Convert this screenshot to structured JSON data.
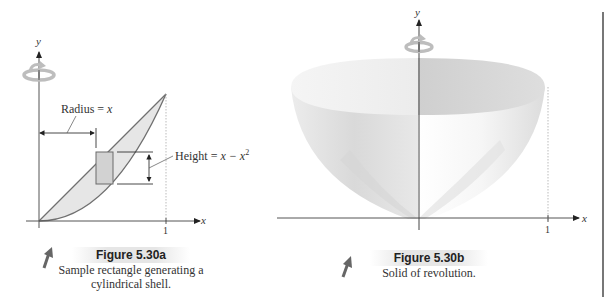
{
  "figure_a": {
    "title": "Figure 5.30a",
    "caption_line1": "Sample rectangle generating a",
    "caption_line2": "cylindrical shell.",
    "axes": {
      "x_label": "x",
      "y_label": "y",
      "x_tick": "1"
    },
    "annotations": {
      "radius_label": "Radius = ",
      "radius_var": "x",
      "height_label": "Height = ",
      "height_expr": "x − x",
      "height_exp": "2"
    },
    "curves": [
      "y = x",
      "y = x^2"
    ],
    "icons": [
      "rotation-arrow-icon",
      "pointer-arrow-icon"
    ]
  },
  "figure_b": {
    "title": "Figure 5.30b",
    "caption": "Solid of revolution.",
    "axes": {
      "x_label": "x",
      "y_label": "y",
      "x_tick": "1"
    },
    "icons": [
      "rotation-arrow-icon",
      "pointer-arrow-icon"
    ]
  },
  "colors": {
    "axis": "#555555",
    "curve": "#707070",
    "region_fill": "#e4e4e4",
    "rect_fill": "#cfcfcf",
    "surface_light": "#f4f4f4",
    "surface_dark": "#c8c8c8",
    "rotation_icon": "#b9b9b9",
    "pointer_icon": "#6a6a6a",
    "title_band": "#e6e6e6"
  }
}
